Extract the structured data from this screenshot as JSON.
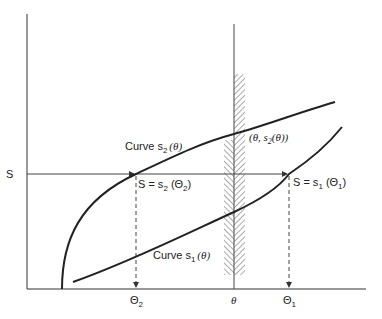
{
  "diagram": {
    "axes": {
      "y_axis_label": "S",
      "x_ticks": [
        {
          "id": "theta2",
          "label": "Θ",
          "sub": "2"
        },
        {
          "id": "theta",
          "label": "θ"
        },
        {
          "id": "theta1",
          "label": "Θ",
          "sub": "1"
        }
      ]
    },
    "curves": {
      "s2": {
        "label_prefix": "Curve s",
        "label_sub": "2",
        "label_suffix": "(θ)"
      },
      "s1": {
        "label_prefix": "Curve s",
        "label_sub": "1",
        "label_suffix": "(θ)"
      }
    },
    "annotations": {
      "point_s2": {
        "text_prefix": "(θ, s",
        "sub": "2",
        "text_suffix": "(θ))"
      },
      "eq_s2": {
        "prefix": "S = s",
        "sub": "2",
        "suffix": " (Θ",
        "sub2": "2",
        "end": ")"
      },
      "eq_s1": {
        "prefix": "S = s",
        "sub": "1",
        "suffix": " (Θ",
        "sub2": "1",
        "end": ")"
      }
    },
    "colors": {
      "line": "#222222",
      "axis": "#333333",
      "hatch": "#555555"
    }
  }
}
